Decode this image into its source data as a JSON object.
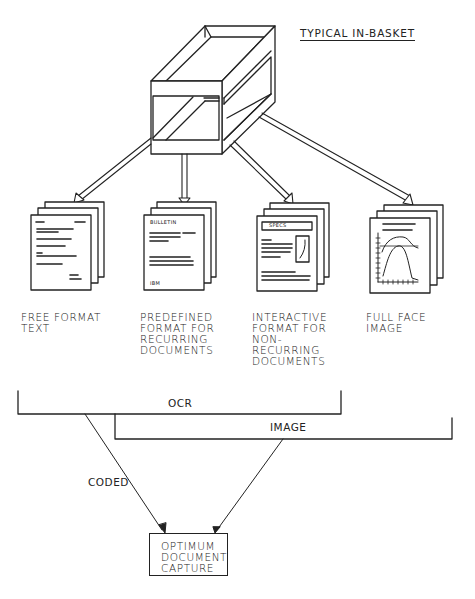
{
  "title": "TYPICAL IN-BASKET",
  "basket": {
    "name": "in-basket"
  },
  "documents": [
    {
      "id": "free-format",
      "label": "FREE FORMAT\nTEXT",
      "icon": "text-document-stack-icon"
    },
    {
      "id": "predefined",
      "label": "PREDEFINED\nFORMAT FOR\nRECURRING\nDOCUMENTS",
      "icon": "bulletin-form-stack-icon",
      "header_text": "BULLETIN",
      "footer_text": "IBM"
    },
    {
      "id": "interactive",
      "label": "INTERACTIVE\nFORMAT FOR\nNON-\nRECURRING\nDOCUMENTS",
      "icon": "specs-form-stack-icon",
      "header_text": "SPECS"
    },
    {
      "id": "full-face",
      "label": "FULL FACE\nIMAGE",
      "icon": "graph-image-stack-icon"
    }
  ],
  "brackets": {
    "ocr": {
      "label": "OCR"
    },
    "image": {
      "label": "IMAGE"
    }
  },
  "flow": {
    "coded_label": "CODED"
  },
  "output": {
    "label": "OPTIMUM\nDOCUMENT\nCAPTURE"
  },
  "colors": {
    "ink": "#222222",
    "background": "#ffffff"
  }
}
